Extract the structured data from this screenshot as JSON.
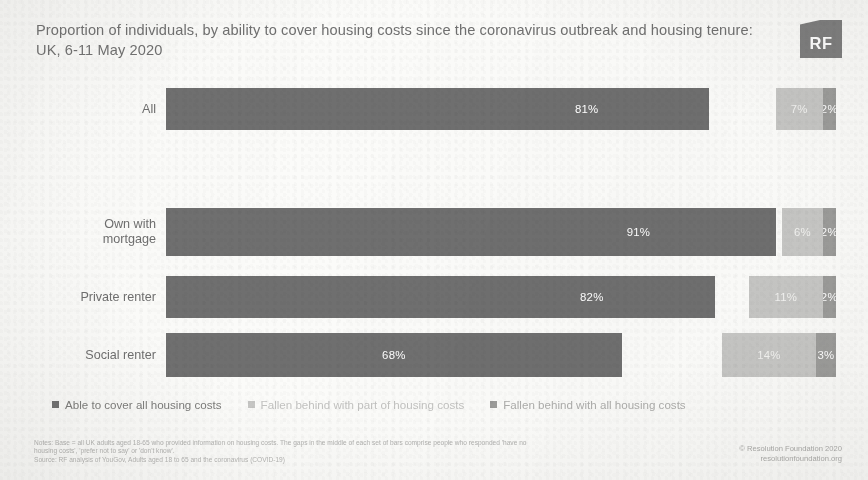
{
  "title": "Proportion of individuals, by ability to cover housing costs since the coronavirus outbreak and housing tenure: UK, 6-11 May 2020",
  "logo": {
    "text": "RF",
    "name": "resolution-foundation-logo"
  },
  "chart_data": {
    "type": "bar",
    "orientation": "horizontal",
    "stacked": true,
    "title": "Proportion of individuals, by ability to cover housing costs since the coronavirus outbreak and housing tenure: UK, 6-11 May 2020",
    "xlabel": "",
    "ylabel": "",
    "xlim": [
      0,
      100
    ],
    "grid": false,
    "legend_position": "bottom",
    "categories": [
      "All",
      "Own with mortgage",
      "Private renter",
      "Social renter"
    ],
    "series": [
      {
        "name": "Able to cover all housing costs",
        "color": "#6f6f6f",
        "values": [
          81,
          91,
          82,
          68
        ],
        "labels": [
          "81%",
          "91%",
          "82%",
          "68%"
        ]
      },
      {
        "name": "Fallen behind with part of housing costs",
        "color": "#c6c6c4",
        "values": [
          7,
          6,
          11,
          14
        ],
        "labels": [
          "7%",
          "6%",
          "11%",
          "14%"
        ]
      },
      {
        "name": "Fallen behind with all housing costs",
        "color": "#9b9b99",
        "values": [
          2,
          2,
          2,
          3
        ],
        "labels": [
          "2%",
          "2%",
          "2%",
          "3%"
        ]
      }
    ]
  },
  "rows": [
    {
      "label": "All",
      "segments": [
        {
          "value": 81,
          "label": "81%"
        },
        {
          "value": 7,
          "label": "7%"
        },
        {
          "value": 2,
          "label": "2%"
        }
      ]
    },
    {
      "label": "Own with mortgage",
      "segments": [
        {
          "value": 91,
          "label": "91%"
        },
        {
          "value": 6,
          "label": "6%"
        },
        {
          "value": 2,
          "label": "2%"
        }
      ]
    },
    {
      "label": "Private renter",
      "segments": [
        {
          "value": 82,
          "label": "82%"
        },
        {
          "value": 11,
          "label": "11%"
        },
        {
          "value": 2,
          "label": "2%"
        }
      ]
    },
    {
      "label": "Social renter",
      "segments": [
        {
          "value": 68,
          "label": "68%"
        },
        {
          "value": 14,
          "label": "14%"
        },
        {
          "value": 3,
          "label": "3%"
        }
      ]
    }
  ],
  "legend": [
    "Able to cover all housing costs",
    "Fallen behind with part of housing costs",
    "Fallen behind with all housing costs"
  ],
  "footer": {
    "notes_line1": "Notes: Base = all UK adults aged 18-65 who provided information on housing costs. The gaps in the middle of each set of bars comprise people who responded 'have no",
    "notes_line2": "housing costs', 'prefer not to say' or 'don't know'.",
    "notes_line3": "Source: RF analysis of YouGov, Adults aged 18 to 65 and the coronavirus (COVID-19)",
    "credit_line1": "© Resolution Foundation 2020",
    "credit_line2": "resolutionfoundation.org"
  }
}
